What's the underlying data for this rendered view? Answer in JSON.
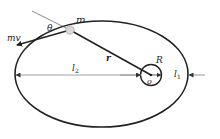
{
  "diagram": {
    "type": "orbit-angular-momentum",
    "colors": {
      "stroke": "#222222",
      "thin": "#555555",
      "mass_fill": "#d8d8d8",
      "background": "#ffffff"
    },
    "labels": {
      "mass": "m",
      "momentum": "mv",
      "angle": "θ",
      "radius_vector": "r",
      "planet_radius": "R",
      "center": "o",
      "far_distance": "l",
      "far_distance_sub": "2",
      "near_distance": "l",
      "near_distance_sub": "1"
    }
  }
}
